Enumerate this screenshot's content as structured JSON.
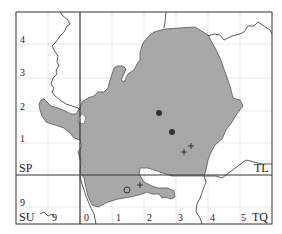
{
  "map": {
    "title": "Distribution map (Hertfordshire vice-county)",
    "colors": {
      "frame": "#333333",
      "grid": "#dddddd",
      "county_fill": "#a8a8a8",
      "county_stroke": "#555555",
      "boundary": "#333333",
      "dot": "#333333"
    },
    "square_labels": {
      "sp": "SP",
      "tl": "TL",
      "su": "SU",
      "tq": "TQ"
    },
    "y_ticks_left": [
      "4",
      "3",
      "2",
      "1",
      "9"
    ],
    "x_ticks_bottom": [
      "9",
      "0",
      "1",
      "2",
      "3",
      "4",
      "5"
    ],
    "records": {
      "solid_dots": 2,
      "open_circles": 1,
      "crosses": 3
    }
  }
}
